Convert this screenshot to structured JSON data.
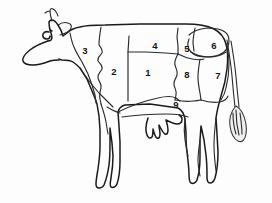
{
  "diagram": {
    "orientation": "facing-left",
    "background_color": "#fdfdfd",
    "line_color": "#1a1a1a",
    "number_color": "#151515",
    "style": "black-and-white line drawing"
  },
  "cuts": [
    {
      "id": "cut-1",
      "label": "1",
      "x": 148,
      "y": 72
    },
    {
      "id": "cut-2",
      "label": "2",
      "x": 114,
      "y": 71
    },
    {
      "id": "cut-3",
      "label": "3",
      "x": 85,
      "y": 50
    },
    {
      "id": "cut-4",
      "label": "4",
      "x": 155,
      "y": 45
    },
    {
      "id": "cut-5",
      "label": "5",
      "x": 187,
      "y": 48
    },
    {
      "id": "cut-6",
      "label": "6",
      "x": 214,
      "y": 45
    },
    {
      "id": "cut-7",
      "label": "7",
      "x": 218,
      "y": 75
    },
    {
      "id": "cut-8",
      "label": "8",
      "x": 187,
      "y": 74
    },
    {
      "id": "cut-9",
      "label": "9",
      "x": 176,
      "y": 104
    }
  ],
  "anatomy_parts": [
    {
      "id": "head",
      "name": "head"
    },
    {
      "id": "ear",
      "name": "ear"
    },
    {
      "id": "horn",
      "name": "horn"
    },
    {
      "id": "eye",
      "name": "eye"
    },
    {
      "id": "muzzle",
      "name": "muzzle"
    },
    {
      "id": "neck",
      "name": "neck"
    },
    {
      "id": "back",
      "name": "back"
    },
    {
      "id": "foreleg-front",
      "name": "front-foreleg"
    },
    {
      "id": "foreleg-rear",
      "name": "rear-foreleg"
    },
    {
      "id": "hindleg-front",
      "name": "front-hindleg"
    },
    {
      "id": "hindleg-rear",
      "name": "rear-hindleg"
    },
    {
      "id": "udder",
      "name": "udder"
    },
    {
      "id": "tail",
      "name": "tail"
    },
    {
      "id": "tail-tassel",
      "name": "tail-tassel"
    },
    {
      "id": "brisket",
      "name": "brisket"
    },
    {
      "id": "belly",
      "name": "belly"
    },
    {
      "id": "rump",
      "name": "rump"
    }
  ]
}
